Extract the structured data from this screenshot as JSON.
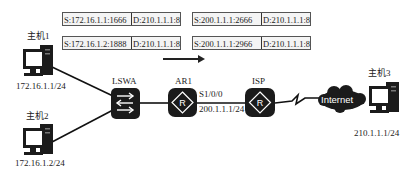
{
  "nat_tables": {
    "before": [
      {
        "source": "S:172.16.1.1:1666",
        "dest": "D:210.1.1.1:80"
      },
      {
        "source": "S:172.16.1.2:1888",
        "dest": "D:210.1.1.1:80"
      }
    ],
    "after": [
      {
        "source": "S:200.1.1.1:2666",
        "dest": "D:210.1.1.1:80"
      },
      {
        "source": "S:200.1.1.1:2966",
        "dest": "D:210.1.1.1:80"
      }
    ]
  },
  "hosts": {
    "host1": {
      "label": "主机1",
      "ip": "172.16.1.1/24"
    },
    "host2": {
      "label": "主机2",
      "ip": "172.16.1.2/24"
    },
    "host3": {
      "label": "主机3",
      "ip": "210.1.1.1/24"
    }
  },
  "devices": {
    "switch": {
      "label": "LSWA",
      "icon": "switch-icon"
    },
    "router1": {
      "label": "AR1",
      "icon": "router-icon",
      "interface": "S1/0/0",
      "ip": "200.1.1.1/24"
    },
    "isp": {
      "label": "ISP",
      "icon": "router-icon"
    },
    "internet": {
      "label": "Internet",
      "icon": "cloud-icon"
    }
  },
  "colors": {
    "device_fill": "#1b1b1b",
    "line": "#111111",
    "table_border": "#555555"
  }
}
